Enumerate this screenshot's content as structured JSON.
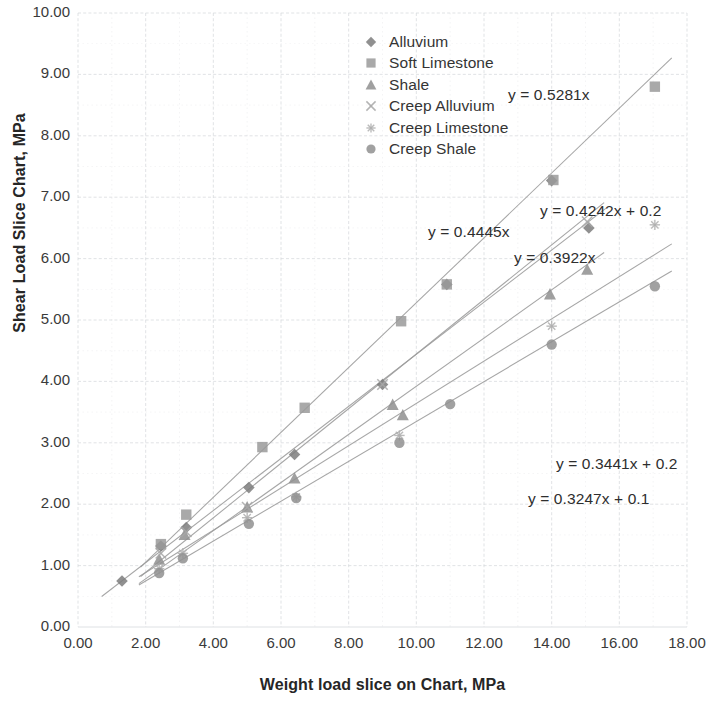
{
  "chart_data": {
    "type": "scatter",
    "title": "",
    "xlabel": "Weight load slice on Chart, MPa",
    "ylabel": "Shear Load Slice Chart, MPa",
    "xlim": [
      0,
      18
    ],
    "ylim": [
      0,
      10
    ],
    "xticks": [
      "0.00",
      "2.00",
      "4.00",
      "6.00",
      "8.00",
      "10.00",
      "12.00",
      "14.00",
      "16.00",
      "18.00"
    ],
    "yticks": [
      "0.00",
      "1.00",
      "2.00",
      "3.00",
      "4.00",
      "5.00",
      "6.00",
      "7.00",
      "8.00",
      "9.00",
      "10.00"
    ],
    "xtick_values": [
      0,
      2,
      4,
      6,
      8,
      10,
      12,
      14,
      16,
      18
    ],
    "ytick_values": [
      0,
      1,
      2,
      3,
      4,
      5,
      6,
      7,
      8,
      9,
      10
    ],
    "grid": true,
    "grid_color": "#d6d9dd",
    "legend_position": "top-center",
    "series": [
      {
        "name": "Alluvium",
        "marker": "diamond",
        "color": "#7d7d7d",
        "fit_label": "y = 0.4242x + 0.2",
        "fit_slope": 0.4242,
        "fit_intercept": 0.2,
        "points": [
          {
            "x": 1.3,
            "y": 0.75
          },
          {
            "x": 2.45,
            "y": 1.32
          },
          {
            "x": 3.2,
            "y": 1.62
          },
          {
            "x": 5.05,
            "y": 2.27
          },
          {
            "x": 6.4,
            "y": 2.81
          },
          {
            "x": 9.0,
            "y": 3.95
          },
          {
            "x": 10.9,
            "y": 5.58
          },
          {
            "x": 14.0,
            "y": 7.27
          },
          {
            "x": 15.1,
            "y": 6.5
          }
        ]
      },
      {
        "name": "Soft Limestone",
        "marker": "square",
        "color": "#9a9a9a",
        "fit_label": "y = 0.5281x",
        "fit_slope": 0.5281,
        "fit_intercept": 0.0,
        "points": [
          {
            "x": 2.45,
            "y": 1.35
          },
          {
            "x": 3.2,
            "y": 1.83
          },
          {
            "x": 5.45,
            "y": 2.93
          },
          {
            "x": 6.7,
            "y": 3.57
          },
          {
            "x": 9.55,
            "y": 4.98
          },
          {
            "x": 10.9,
            "y": 5.58
          },
          {
            "x": 14.05,
            "y": 7.28
          },
          {
            "x": 17.05,
            "y": 8.8
          }
        ]
      },
      {
        "name": "Shale",
        "marker": "triangle",
        "color": "#8f8f8f",
        "fit_label": "y = 0.3922x",
        "fit_slope": 0.3922,
        "fit_intercept": 0.0,
        "points": [
          {
            "x": 2.4,
            "y": 1.1
          },
          {
            "x": 3.15,
            "y": 1.5
          },
          {
            "x": 5.0,
            "y": 1.95
          },
          {
            "x": 6.4,
            "y": 2.42
          },
          {
            "x": 9.3,
            "y": 3.62
          },
          {
            "x": 9.6,
            "y": 3.45
          },
          {
            "x": 13.95,
            "y": 5.42
          },
          {
            "x": 15.05,
            "y": 5.82
          }
        ]
      },
      {
        "name": "Creep Alluvium",
        "marker": "cross",
        "color": "#a8a8a8",
        "fit_label": "y = 0.4445x",
        "fit_slope": 0.4445,
        "fit_intercept": 0.0,
        "points": [
          {
            "x": 2.45,
            "y": 1.2
          },
          {
            "x": 3.2,
            "y": 1.55
          },
          {
            "x": 5.0,
            "y": 1.95
          },
          {
            "x": 9.0,
            "y": 3.95
          },
          {
            "x": 15.05,
            "y": 6.6
          }
        ]
      },
      {
        "name": "Creep Limestone",
        "marker": "star",
        "color": "#b0b0b0",
        "fit_label": "y = 0.3441x + 0.2",
        "fit_slope": 0.3441,
        "fit_intercept": 0.2,
        "points": [
          {
            "x": 2.4,
            "y": 0.95
          },
          {
            "x": 3.1,
            "y": 1.2
          },
          {
            "x": 5.0,
            "y": 1.78
          },
          {
            "x": 6.45,
            "y": 2.12
          },
          {
            "x": 9.5,
            "y": 3.12
          },
          {
            "x": 14.0,
            "y": 4.9
          },
          {
            "x": 17.05,
            "y": 6.55
          }
        ]
      },
      {
        "name": "Creep Shale",
        "marker": "circle",
        "color": "#919191",
        "fit_label": "y = 0.3247x + 0.1",
        "fit_slope": 0.3247,
        "fit_intercept": 0.1,
        "points": [
          {
            "x": 2.4,
            "y": 0.88
          },
          {
            "x": 3.1,
            "y": 1.12
          },
          {
            "x": 5.05,
            "y": 1.68
          },
          {
            "x": 6.45,
            "y": 2.1
          },
          {
            "x": 9.5,
            "y": 3.0
          },
          {
            "x": 11.0,
            "y": 3.63
          },
          {
            "x": 14.0,
            "y": 4.6
          },
          {
            "x": 17.05,
            "y": 5.55
          }
        ]
      }
    ],
    "annotations": [
      {
        "text": "y = 0.5281x",
        "x_px": 508,
        "y_px": 86
      },
      {
        "text": "y = 0.4242x + 0.2",
        "x_px": 540,
        "y_px": 202
      },
      {
        "text": "y = 0.4445x",
        "x_px": 428,
        "y_px": 223
      },
      {
        "text": "y = 0.3922x",
        "x_px": 514,
        "y_px": 249
      },
      {
        "text": "y = 0.3441x + 0.2",
        "x_px": 556,
        "y_px": 455
      },
      {
        "text": "y = 0.3247x + 0.1",
        "x_px": 528,
        "y_px": 490
      }
    ]
  }
}
